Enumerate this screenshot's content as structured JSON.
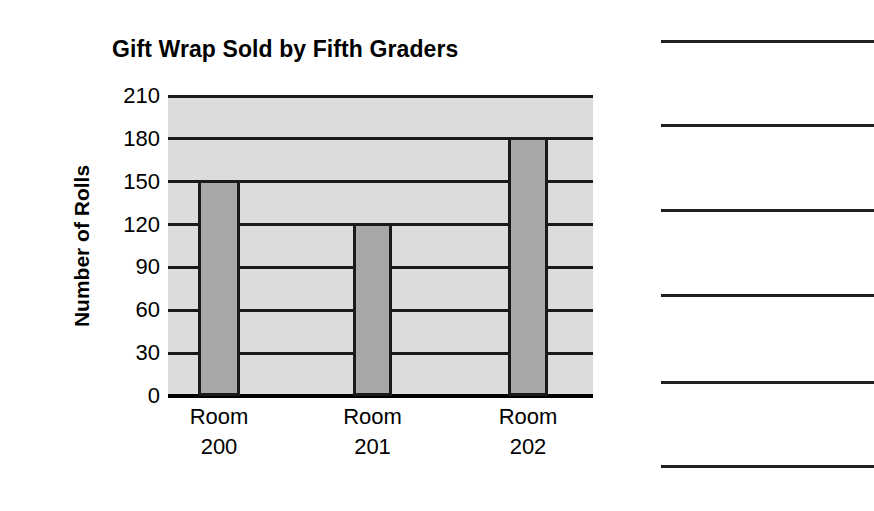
{
  "worksheet": {
    "background_color": "#ffffff",
    "answer_lines": {
      "name": "answer-rule-lines",
      "count": 6,
      "y_positions": [
        40,
        124,
        209,
        294,
        381,
        465
      ],
      "left": 661,
      "width": 213,
      "color": "#1f1f1f"
    }
  },
  "chart_data": {
    "type": "bar",
    "title": "Gift Wrap Sold by Fifth Graders",
    "xlabel": "",
    "ylabel": "Number of Rolls",
    "categories": [
      "Room 200",
      "Room 201",
      "Room 202"
    ],
    "category_lines": [
      {
        "line1": "Room",
        "line2": "200"
      },
      {
        "line1": "Room",
        "line2": "201"
      },
      {
        "line1": "Room",
        "line2": "202"
      }
    ],
    "values": [
      150,
      120,
      180
    ],
    "ylim": [
      0,
      210
    ],
    "ytick_step": 30,
    "yticks": [
      210,
      180,
      150,
      120,
      90,
      60,
      30,
      0
    ],
    "ytick_labels": [
      "210",
      "180",
      "150",
      "120",
      "90",
      "60",
      "30",
      "0"
    ],
    "grid": true,
    "legend": "none",
    "colors": {
      "bar_fill": "#a8a8a8",
      "bar_edge": "#1a1a1a",
      "plot_background": "#dcdcdc",
      "gridline": "#1a1a1a",
      "axis": "#000000",
      "text": "#000000"
    },
    "bars": [
      {
        "category": "Room 200",
        "value": 150,
        "x_left": 30,
        "width": 42
      },
      {
        "category": "Room 201",
        "value": 120,
        "x_left": 185,
        "width": 39
      },
      {
        "category": "Room 202",
        "value": 180,
        "x_left": 340,
        "width": 40
      }
    ]
  }
}
